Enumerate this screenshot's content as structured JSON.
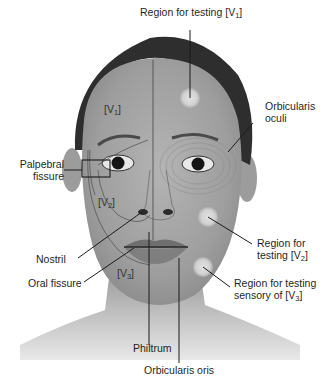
{
  "figure": {
    "colors": {
      "background": "#ffffff",
      "skin": "#a9a9a9",
      "hair": "#2e2e2e",
      "test_region": "#d6d6d6",
      "line": "#1a1a1a"
    }
  },
  "labels": {
    "region_v1": {
      "pre": "Region for testing [V",
      "sub": "1",
      "post": "]"
    },
    "orbicularis_oculi": {
      "line1": "Orbicularis",
      "line2": "oculi"
    },
    "palpebral_fissure": {
      "line1": "Palpebral",
      "line2": "fissure"
    },
    "nostril": "Nostril",
    "oral_fissure": "Oral fissure",
    "region_v2": {
      "line1": "Region for",
      "line2_pre": "testing [V",
      "sub": "2",
      "post": "]"
    },
    "region_v3": {
      "line1": "Region for testing",
      "line2_pre": "sensory of [V",
      "sub": "3",
      "post": "]"
    },
    "philtrum": "Philtrum",
    "orbicularis_oris": "Orbicularis oris"
  },
  "dermatomes": [
    {
      "pre": "[V",
      "sub": "1",
      "post": "]"
    },
    {
      "pre": "[V",
      "sub": "2",
      "post": "]"
    },
    {
      "pre": "[V",
      "sub": "3",
      "post": "]"
    }
  ]
}
